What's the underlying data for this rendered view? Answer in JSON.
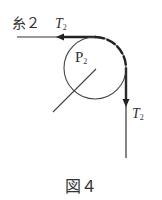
{
  "figure": {
    "caption": "図４",
    "string_label": "糸２",
    "pulley_label": "P",
    "pulley_subscript": "2",
    "tension_top_label": "T",
    "tension_top_subscript": "2",
    "tension_right_label": "T",
    "tension_right_subscript": "2"
  },
  "colors": {
    "line": "#333333",
    "background": "#ffffff"
  }
}
